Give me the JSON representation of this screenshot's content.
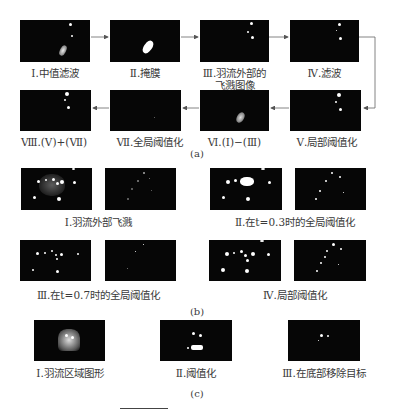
{
  "figure_a": {
    "caption": "(a)",
    "row1": [
      {
        "label": "Ⅰ.中值滤波"
      },
      {
        "label": "Ⅱ.掩膜"
      },
      {
        "label": "Ⅲ.羽流外部的",
        "label2": "飞溅图像"
      },
      {
        "label": "Ⅳ.滤波"
      }
    ],
    "row2": [
      {
        "label": "Ⅷ.(Ⅴ)+(Ⅶ)"
      },
      {
        "label": "Ⅶ.全局阈值化"
      },
      {
        "label": "Ⅵ.(Ⅰ)−(Ⅲ)"
      },
      {
        "label": "Ⅴ.局部阈值化"
      }
    ]
  },
  "figure_b": {
    "caption": "(b)",
    "groups": [
      {
        "label": "Ⅰ.羽流外部飞溅"
      },
      {
        "label": "Ⅱ.在t=0.3时的全局阈值化"
      },
      {
        "label": "Ⅲ.在t=0.7时的全局阈值化"
      },
      {
        "label": "Ⅳ.局部阈值化"
      }
    ]
  },
  "figure_c": {
    "caption": "(c)",
    "panels": [
      {
        "label": "Ⅰ.羽流区域图形"
      },
      {
        "label": "Ⅱ.阈值化"
      },
      {
        "label": "Ⅲ.在底部移除目标"
      }
    ]
  },
  "colors": {
    "panel_bg": "#060606",
    "arrow": "#555555",
    "text": "#3a3a3a"
  }
}
